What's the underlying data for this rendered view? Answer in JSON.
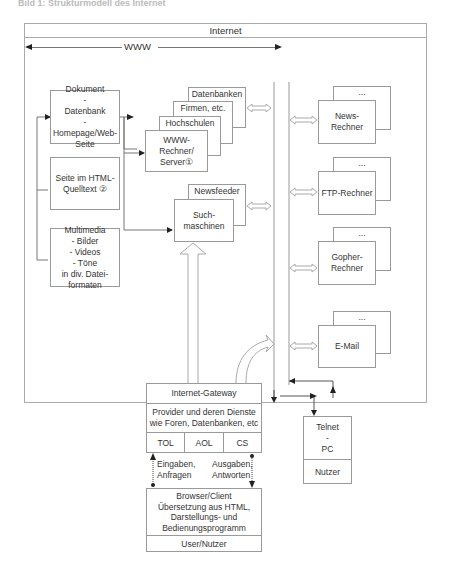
{
  "caption": "Bild 1: Strukturmodell des Internet",
  "frame": {
    "title": "Internet",
    "www_label": "WWW"
  },
  "left_column": {
    "doc_box": "Dokument\n-\nDatenbank\n-\nHomepage/Web-\nSeite",
    "html_box": "Seite im HTML-\nQuelltext  ②",
    "media_box": "Multimedia\n- Bilder\n- Videos\n- Töne\nin div. Datei-\nformaten"
  },
  "server_stack": {
    "layer1": "Datenbanken",
    "layer2": "Firmen, etc.",
    "layer3": "Hochschulen",
    "front": "WWW-\nRechner/\nServer①"
  },
  "search_stack": {
    "back": "Newsfeeder",
    "front": "Such-\nmaschinen"
  },
  "right_column": {
    "ellipsis": "...",
    "news": "News-\nRechner",
    "ftp": "FTP-Rechner",
    "gopher": "Gopher-\nRechner",
    "email": "E-Mail"
  },
  "gateway": {
    "title": "Internet-Gateway",
    "providers": "Provider und deren Dienste\nwie Foren, Datenbanken, etc",
    "services": [
      "TOL",
      "AOL",
      "CS"
    ]
  },
  "flows": {
    "input": "Eingaben,\nAnfragen",
    "output": "Ausgaben,\nAntworten"
  },
  "client": {
    "main": "Browser/Client\nÜbersetzung aus HTML,\nDarstellungs- und\nBedienungsprogramm",
    "user": "User/Nutzer"
  },
  "telnet": {
    "main": "Telnet\n-\nPC",
    "user": "Nutzer"
  }
}
